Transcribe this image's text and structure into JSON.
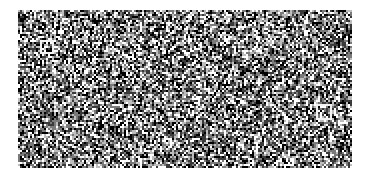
{
  "canvas": {
    "width": 371,
    "height": 179,
    "background": "#ffffff"
  },
  "noise_area": {
    "x": 18,
    "y": 10,
    "width": 334,
    "height": 158,
    "palette": [
      "#000000",
      "#3a3a3a",
      "#7a7a7a",
      "#bdbdbd",
      "#ffffff"
    ],
    "cell": 2
  },
  "markers": [
    {
      "x": 40,
      "y": 40,
      "width": 14,
      "height": 14
    },
    {
      "x": 316,
      "y": 104,
      "width": 16,
      "height": 16
    }
  ]
}
